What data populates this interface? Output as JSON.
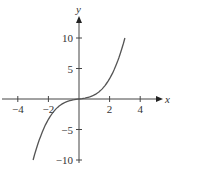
{
  "chart_data": {
    "type": "line",
    "title": "",
    "xlabel": "x",
    "ylabel": "y",
    "xlim": [
      -5,
      5.5
    ],
    "ylim": [
      -12,
      14
    ],
    "xticks": [
      -4,
      -2,
      2,
      4
    ],
    "yticks": [
      -10,
      -5,
      5,
      10
    ],
    "xtick_labels": [
      "−4",
      "−2",
      "2",
      "4"
    ],
    "ytick_labels": [
      "−10",
      "−5",
      "5",
      "10"
    ],
    "grid": false,
    "series": [
      {
        "name": "curve",
        "x": [
          -3,
          -2.5,
          -2,
          -1.5,
          -1,
          -0.5,
          0,
          0.5,
          1,
          1.5,
          2,
          2.5,
          3
        ],
        "y": [
          -10,
          -6.04,
          -3.33,
          -1.63,
          -0.67,
          -0.21,
          0,
          0.21,
          0.67,
          1.63,
          3.33,
          6.04,
          10
        ]
      }
    ]
  }
}
